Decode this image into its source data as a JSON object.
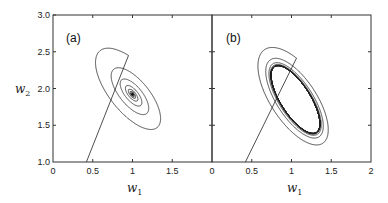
{
  "chart_data": [
    {
      "type": "line",
      "panel_label": "(a)",
      "title": "",
      "xlabel": "w1",
      "ylabel": "w2",
      "xlim": [
        0,
        2
      ],
      "ylim": [
        1.0,
        3.0
      ],
      "xticks": [
        "0",
        "0.5",
        "1",
        "1.5"
      ],
      "yticks": [
        "1.0",
        "1.5",
        "2.0",
        "2.5",
        "3.0"
      ],
      "grid": false,
      "description": "Phase-plane trajectory spiraling inward to a stable fixed point",
      "series": [
        {
          "name": "trajectory",
          "behavior": "spiral converging to fixed point",
          "start": [
            0.42,
            1.0
          ],
          "outer_loop_max": [
            0.85,
            2.62
          ],
          "outer_loop_right": [
            1.7,
            1.3
          ],
          "fixed_point": [
            1.0,
            1.92
          ]
        }
      ]
    },
    {
      "type": "line",
      "panel_label": "(b)",
      "title": "",
      "xlabel": "w1",
      "ylabel": "",
      "xlim": [
        0,
        2
      ],
      "ylim": [
        1.0,
        3.0
      ],
      "xticks": [
        "0",
        "0.5",
        "1",
        "1.5",
        "2"
      ],
      "yticks": [],
      "grid": false,
      "description": "Phase-plane trajectory spiraling inward to a stable limit cycle",
      "series": [
        {
          "name": "trajectory",
          "behavior": "spiral converging to limit cycle",
          "start": [
            0.42,
            1.0
          ],
          "outer_loop_max": [
            0.85,
            2.65
          ],
          "outer_loop_right": [
            1.78,
            1.28
          ],
          "limit_cycle_center": [
            1.05,
            1.85
          ],
          "limit_cycle_w1_range": [
            0.75,
            1.32
          ],
          "limit_cycle_w2_range": [
            1.45,
            2.38
          ]
        }
      ]
    }
  ],
  "labels": {
    "panel_a": "(a)",
    "panel_b": "(b)",
    "x_axis_a": "w",
    "x_axis_a_sub": "1",
    "x_axis_b": "w",
    "x_axis_b_sub": "1",
    "y_axis": "w",
    "y_axis_sub": "2",
    "yticks": [
      "3.0",
      "2.5",
      "2.0",
      "1.5",
      "1.0"
    ],
    "xticks_a": [
      "0",
      "0.5",
      "1",
      "1.5"
    ],
    "xticks_b": [
      "0",
      "0.5",
      "1",
      "1.5",
      "2"
    ]
  }
}
